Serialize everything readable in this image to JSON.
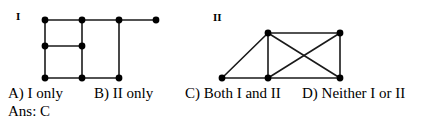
{
  "figures": {
    "one": {
      "label": "I",
      "caption_name": "graph-one"
    },
    "two": {
      "label": "II",
      "caption_name": "graph-two"
    }
  },
  "options": {
    "a": "A)  I only",
    "b": "B)  II only",
    "c": "C)  Both I and II",
    "d": "D)  Neither I or II"
  },
  "answer": {
    "text": "Ans: C"
  },
  "colors": {
    "ink": "#000000",
    "edge": "#1a1a1a",
    "background": "#ffffff"
  },
  "chart_data": {
    "type": "diagram",
    "title": "",
    "graphs": [
      {
        "name": "I",
        "nodes": [
          {
            "id": "t1",
            "x": 45,
            "y": 20
          },
          {
            "id": "t2",
            "x": 82,
            "y": 20
          },
          {
            "id": "t3",
            "x": 119,
            "y": 20
          },
          {
            "id": "t4",
            "x": 156,
            "y": 20
          },
          {
            "id": "m1",
            "x": 45,
            "y": 46
          },
          {
            "id": "m2",
            "x": 82,
            "y": 46
          },
          {
            "id": "b1",
            "x": 45,
            "y": 78
          },
          {
            "id": "b2",
            "x": 82,
            "y": 78
          },
          {
            "id": "b3",
            "x": 119,
            "y": 78
          }
        ],
        "edges": [
          [
            "t1",
            "t2"
          ],
          [
            "t2",
            "t3"
          ],
          [
            "t3",
            "t4"
          ],
          [
            "t1",
            "m1"
          ],
          [
            "m1",
            "b1"
          ],
          [
            "t2",
            "m2"
          ],
          [
            "m2",
            "b2"
          ],
          [
            "m1",
            "m2"
          ],
          [
            "t3",
            "b3"
          ],
          [
            "b1",
            "b2"
          ],
          [
            "b2",
            "b3"
          ]
        ]
      },
      {
        "name": "II",
        "nodes": [
          {
            "id": "p1",
            "x": 222,
            "y": 78
          },
          {
            "id": "p2",
            "x": 268,
            "y": 33
          },
          {
            "id": "p3",
            "x": 340,
            "y": 33
          },
          {
            "id": "p4",
            "x": 268,
            "y": 78
          },
          {
            "id": "p5",
            "x": 340,
            "y": 78
          }
        ],
        "edges": [
          [
            "p1",
            "p2"
          ],
          [
            "p1",
            "p4"
          ],
          [
            "p2",
            "p3"
          ],
          [
            "p2",
            "p4"
          ],
          [
            "p2",
            "p5"
          ],
          [
            "p3",
            "p4"
          ],
          [
            "p3",
            "p5"
          ],
          [
            "p4",
            "p5"
          ]
        ]
      }
    ]
  }
}
